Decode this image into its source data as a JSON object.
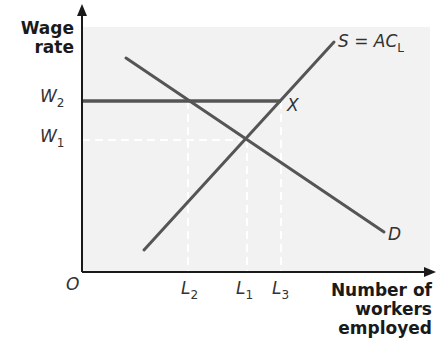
{
  "diagram": {
    "type": "labour-market-monopsony-minimum-wage",
    "y_axis_title_line1": "Wage",
    "y_axis_title_line2": "rate",
    "x_axis_title_line1": "Number of",
    "x_axis_title_line2": "workers",
    "x_axis_title_line3": "employed",
    "origin_label": "O",
    "y_ticks": [
      {
        "main": "W",
        "sub": "2"
      },
      {
        "main": "W",
        "sub": "1"
      }
    ],
    "x_ticks": [
      {
        "main": "L",
        "sub": "2"
      },
      {
        "main": "L",
        "sub": "1"
      },
      {
        "main": "L",
        "sub": "3"
      }
    ],
    "curves": {
      "supply_label_main": "S = AC",
      "supply_label_sub": "L",
      "demand_label": "D",
      "point_label": "X"
    },
    "colors": {
      "plot_background": "#f2f2f2",
      "line": "#555555",
      "axis": "#1a1a1a",
      "dashed": "#ffffff"
    }
  }
}
